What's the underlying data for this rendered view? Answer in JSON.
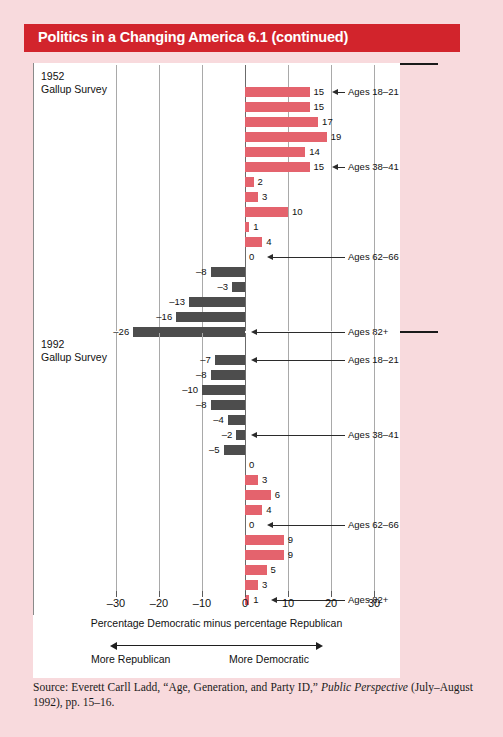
{
  "banner": {
    "title": "Politics in a Changing America 6.1 (continued)"
  },
  "colors": {
    "banner_red": "#d2242c",
    "page_pink": "#f8dadd",
    "bar_positive": "#e4636d",
    "bar_negative": "#4d4d4d",
    "text": "#111111"
  },
  "axis": {
    "ticks": [
      "–30",
      "–20",
      "–10",
      "0",
      "10",
      "20",
      "30"
    ],
    "tick_values": [
      -30,
      -20,
      -10,
      0,
      10,
      20,
      30
    ],
    "title": "Percentage Democratic minus percentage Republican",
    "left_direction": "More Republican",
    "right_direction": "More Democratic"
  },
  "source": {
    "prefix": "Source: Everett Carll Ladd, “Age, Generation, and Party ID,” ",
    "italic": "Public Perspective",
    "suffix": " (July–August 1992), pp. 15–16."
  },
  "chart_data": {
    "type": "bar",
    "title": "Politics in a Changing America 6.1 (continued)",
    "orientation": "horizontal",
    "xlabel": "Percentage Democratic minus percentage Republican",
    "ylabel": "",
    "xlim": [
      -30,
      30
    ],
    "grid": true,
    "legend": "none",
    "panels": [
      {
        "name": "panel-1952",
        "label_line1": "1952",
        "label_line2": "Gallup Survey",
        "values": [
          15,
          15,
          17,
          19,
          14,
          15,
          2,
          3,
          10,
          1,
          4,
          0,
          -8,
          -3,
          -13,
          -16,
          -26
        ],
        "annotations": [
          {
            "row": 0,
            "label": "Ages 18–21"
          },
          {
            "row": 5,
            "label": "Ages 38–41"
          },
          {
            "row": 11,
            "label": "Ages 62–66"
          },
          {
            "row": 16,
            "label": "Ages 82+"
          }
        ]
      },
      {
        "name": "panel-1992",
        "label_line1": "1992",
        "label_line2": "Gallup Survey",
        "values": [
          -7,
          -8,
          -10,
          -8,
          -4,
          -2,
          -5,
          0,
          3,
          6,
          4,
          0,
          9,
          9,
          5,
          3,
          1
        ],
        "annotations": [
          {
            "row": 0,
            "label": "Ages 18–21"
          },
          {
            "row": 5,
            "label": "Ages 38–41"
          },
          {
            "row": 11,
            "label": "Ages 62–66"
          },
          {
            "row": 16,
            "label": "Ages 82+"
          }
        ]
      }
    ]
  }
}
